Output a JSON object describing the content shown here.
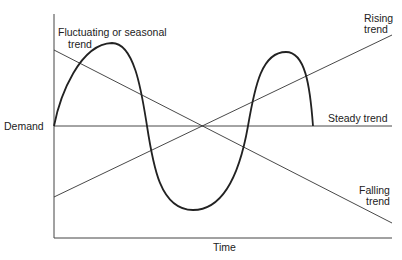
{
  "axes": {
    "y_label": "Demand",
    "x_label": "Time"
  },
  "labels": {
    "fluctuating_line1": "Fluctuating or seasonal",
    "fluctuating_line2": "trend",
    "rising_line1": "Rising",
    "rising_line2": "trend",
    "steady": "Steady trend",
    "falling_line1": "Falling",
    "falling_line2": "trend"
  },
  "colors": {
    "line": "#222222",
    "background": "#ffffff"
  },
  "series": [
    {
      "name": "Fluctuating or seasonal trend",
      "shape": "sinusoidal",
      "description": "rises from origin to a peak, falls below steady level to a trough, rises to a second peak, returns to steady level"
    },
    {
      "name": "Rising trend",
      "shape": "straight line increasing"
    },
    {
      "name": "Steady trend",
      "shape": "horizontal line"
    },
    {
      "name": "Falling trend",
      "shape": "straight line decreasing"
    }
  ]
}
